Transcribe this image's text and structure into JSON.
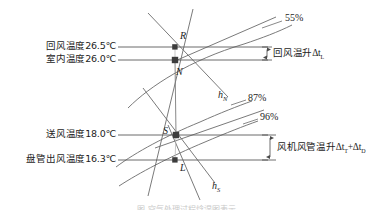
{
  "figure": {
    "type": "psychrometric-process-diagram",
    "title_caption": "图",
    "background": "#ffffff",
    "line_color": "#595959",
    "point_color": "#3c3c3c"
  },
  "left_labels": [
    {
      "id": "return-air-temp",
      "text": "回风温度26.5℃",
      "value": "26.5",
      "unit": "℃",
      "line_y": 47
    },
    {
      "id": "room-temp",
      "text": "室内温度26.0℃",
      "value": "26.0",
      "unit": "℃",
      "line_y": 60
    },
    {
      "id": "supply-air-temp",
      "text": "送风温度18.0℃",
      "value": "18.0",
      "unit": "℃",
      "line_y": 135
    },
    {
      "id": "coil-outlet-temp",
      "text": "盘管出风温度16.3℃",
      "value": "16.3",
      "unit": "℃",
      "line_y": 160
    }
  ],
  "right_labels": [
    {
      "id": "return-air-rise",
      "prefix": "回风温升",
      "sym1": "Δt",
      "sub1": "L",
      "plus": "",
      "sym2": "",
      "sub2": ""
    },
    {
      "id": "fan-duct-rise",
      "prefix": "风机风管温升",
      "sym1": "Δt",
      "sub1": "T",
      "plus": "+",
      "sym2": "Δt",
      "sub2": "D"
    }
  ],
  "rh_labels": [
    {
      "id": "rh-55",
      "text": "55%"
    },
    {
      "id": "rh-87",
      "text": "87%"
    },
    {
      "id": "rh-96",
      "text": "96%"
    }
  ],
  "state_points": [
    {
      "id": "point-R",
      "label": "R",
      "x": 175,
      "y": 47
    },
    {
      "id": "point-N",
      "label": "N",
      "x": 175,
      "y": 60
    },
    {
      "id": "point-S",
      "label": "S",
      "x": 176,
      "y": 135
    },
    {
      "id": "point-L",
      "label": "L",
      "x": 175,
      "y": 160
    }
  ],
  "enthalpy_lines": [
    {
      "id": "enthalpy-hN",
      "sym": "h",
      "sub": "N"
    },
    {
      "id": "enthalpy-hS",
      "sym": "h",
      "sub": "S"
    }
  ],
  "caption": "图   空气处理过程焓湿图表示"
}
